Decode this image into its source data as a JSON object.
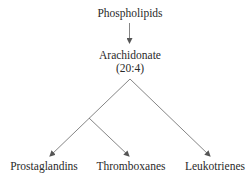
{
  "diagram": {
    "type": "metabolic-pathway",
    "nodes": {
      "phospholipids": "Phospholipids",
      "arachidonate": "Arachidonate",
      "arachidonate_sub": "(20:4)",
      "prostaglandins": "Prostaglandins",
      "thromboxanes": "Thromboxanes",
      "leukotrienes": "Leukotrienes"
    },
    "edges": [
      {
        "from": "Phospholipids",
        "to": "Arachidonate (20:4)"
      },
      {
        "from": "Arachidonate (20:4)",
        "to": "Prostaglandins"
      },
      {
        "from": "Prostaglandins branch",
        "to": "Thromboxanes"
      },
      {
        "from": "Arachidonate (20:4)",
        "to": "Leukotrienes"
      }
    ],
    "line_color": "#6a6a6a"
  }
}
